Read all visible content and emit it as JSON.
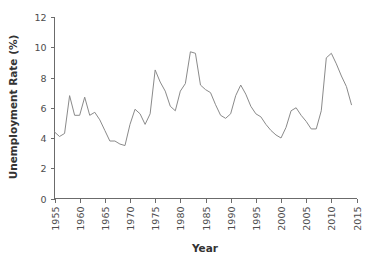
{
  "chart_data": {
    "type": "line",
    "title": "",
    "xlabel": "Year",
    "ylabel": "Unemployment Rate (%)",
    "xlim": [
      1955,
      2015
    ],
    "ylim": [
      0,
      12
    ],
    "grid": false,
    "legend": null,
    "line_color": "#8a8a8a",
    "axis_color": "#6b6b6b",
    "xticks": [
      1955,
      1960,
      1965,
      1970,
      1975,
      1980,
      1985,
      1990,
      1995,
      2000,
      2005,
      2010,
      2015
    ],
    "xtick_labels": [
      "1955",
      "1960",
      "1965",
      "1970",
      "1975",
      "1980",
      "1985",
      "1990",
      "1995",
      "2000",
      "2005",
      "2010",
      "2015"
    ],
    "yticks": [
      0,
      2,
      4,
      6,
      8,
      10,
      12
    ],
    "ytick_labels": [
      "0",
      "2",
      "4",
      "6",
      "8",
      "10",
      "12"
    ],
    "series": [
      {
        "name": "Unemployment Rate",
        "x": [
          1955,
          1956,
          1957,
          1958,
          1959,
          1960,
          1961,
          1962,
          1963,
          1964,
          1965,
          1966,
          1967,
          1968,
          1969,
          1970,
          1971,
          1972,
          1973,
          1974,
          1975,
          1976,
          1977,
          1978,
          1979,
          1980,
          1981,
          1982,
          1983,
          1984,
          1985,
          1986,
          1987,
          1988,
          1989,
          1990,
          1991,
          1992,
          1993,
          1994,
          1995,
          1996,
          1997,
          1998,
          1999,
          2000,
          2001,
          2002,
          2003,
          2004,
          2005,
          2006,
          2007,
          2008,
          2009,
          2010,
          2011,
          2012,
          2013,
          2014
        ],
        "values": [
          4.4,
          4.1,
          4.3,
          6.8,
          5.5,
          5.5,
          6.7,
          5.5,
          5.7,
          5.2,
          4.5,
          3.8,
          3.8,
          3.6,
          3.5,
          4.9,
          5.9,
          5.6,
          4.9,
          5.6,
          8.5,
          7.7,
          7.1,
          6.1,
          5.8,
          7.1,
          7.6,
          9.7,
          9.6,
          7.5,
          7.2,
          7.0,
          6.2,
          5.5,
          5.3,
          5.6,
          6.8,
          7.5,
          6.9,
          6.1,
          5.6,
          5.4,
          4.9,
          4.5,
          4.2,
          4.0,
          4.7,
          5.8,
          6.0,
          5.5,
          5.1,
          4.6,
          4.6,
          5.8,
          9.3,
          9.6,
          8.9,
          8.1,
          7.4,
          6.2
        ]
      }
    ]
  },
  "axes": {
    "ylabel_text": "Unemployment Rate (%)",
    "xlabel_text": "Year"
  }
}
